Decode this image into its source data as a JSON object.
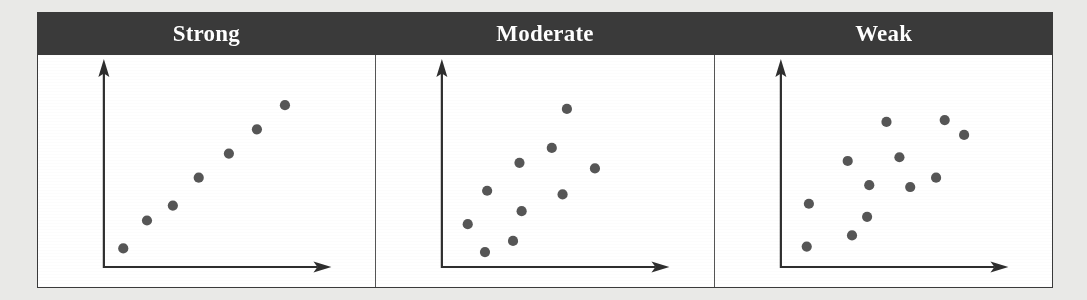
{
  "figure": {
    "background_color": "#e9e9e7",
    "panel_background": "#ffffff",
    "header_background": "#3a3a3a",
    "header_text_color": "#ffffff",
    "dot_color": "#565656",
    "axis_color": "#2e2e2e",
    "border_color": "#3a3a3a"
  },
  "panels": [
    {
      "title": "Strong"
    },
    {
      "title": "Moderate"
    },
    {
      "title": "Weak"
    }
  ],
  "chart_data": [
    {
      "type": "scatter",
      "title": "Strong",
      "xlabel": "",
      "ylabel": "",
      "xlim": [
        0,
        100
      ],
      "ylim": [
        0,
        100
      ],
      "grid": false,
      "legend": "none",
      "axes_style": "arrow-axes-no-ticks",
      "annotations": [
        "Strong positive linear correlation"
      ],
      "points": [
        {
          "x": 9,
          "y": 10
        },
        {
          "x": 20,
          "y": 25
        },
        {
          "x": 32,
          "y": 33
        },
        {
          "x": 44,
          "y": 48
        },
        {
          "x": 58,
          "y": 61
        },
        {
          "x": 71,
          "y": 74
        },
        {
          "x": 84,
          "y": 87
        }
      ]
    },
    {
      "type": "scatter",
      "title": "Moderate",
      "xlabel": "",
      "ylabel": "",
      "xlim": [
        0,
        100
      ],
      "ylim": [
        0,
        100
      ],
      "grid": false,
      "legend": "none",
      "axes_style": "arrow-axes-no-ticks",
      "annotations": [
        "Moderate positive correlation with scatter"
      ],
      "points": [
        {
          "x": 12,
          "y": 23
        },
        {
          "x": 20,
          "y": 8
        },
        {
          "x": 21,
          "y": 41
        },
        {
          "x": 33,
          "y": 14
        },
        {
          "x": 37,
          "y": 30
        },
        {
          "x": 36,
          "y": 56
        },
        {
          "x": 51,
          "y": 64
        },
        {
          "x": 58,
          "y": 85
        },
        {
          "x": 56,
          "y": 39
        },
        {
          "x": 71,
          "y": 53
        }
      ]
    },
    {
      "type": "scatter",
      "title": "Weak",
      "xlabel": "",
      "ylabel": "",
      "xlim": [
        0,
        100
      ],
      "ylim": [
        0,
        100
      ],
      "grid": false,
      "legend": "none",
      "axes_style": "arrow-axes-no-ticks",
      "annotations": [
        "Weak / near-random correlation"
      ],
      "points": [
        {
          "x": 12,
          "y": 11
        },
        {
          "x": 13,
          "y": 34
        },
        {
          "x": 33,
          "y": 17
        },
        {
          "x": 31,
          "y": 57
        },
        {
          "x": 40,
          "y": 27
        },
        {
          "x": 41,
          "y": 44
        },
        {
          "x": 49,
          "y": 78
        },
        {
          "x": 55,
          "y": 59
        },
        {
          "x": 60,
          "y": 43
        },
        {
          "x": 72,
          "y": 48
        },
        {
          "x": 76,
          "y": 79
        },
        {
          "x": 85,
          "y": 71
        }
      ]
    }
  ]
}
